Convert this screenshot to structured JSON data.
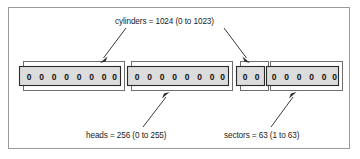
{
  "figure": {
    "background_color": "#ffffff",
    "frame_color": "#9a9a9a"
  },
  "annotations": {
    "cylinders": {
      "label": "cylinders = 1024 (0 to 1023)",
      "name": "cylinders",
      "count": 1024,
      "range_start": 0,
      "range_end": 1023
    },
    "heads": {
      "label": "heads = 256 (0 to 255)",
      "name": "heads",
      "count": 256,
      "range_start": 0,
      "range_end": 255
    },
    "sectors": {
      "label": "sectors = 63 (1 to 63)",
      "name": "sectors",
      "count": 63,
      "range_start": 1,
      "range_end": 63
    }
  },
  "bit_groups": [
    {
      "id": "cylinder-bits-high",
      "digits": "0 0 0 0 0 0 0 0",
      "bit_count": 8,
      "fill": "#dcdcdc"
    },
    {
      "id": "head-bits",
      "digits": "0 0 0 0 0 0 0 0",
      "bit_count": 8,
      "fill": "#dcdcdc"
    },
    {
      "id": "cylinder-bits-low",
      "digits": "0 0",
      "bit_count": 2,
      "fill": "#dcdcdc"
    },
    {
      "id": "sector-bits",
      "digits": "0 0 0 0 0 0",
      "bit_count": 6,
      "fill": "#dcdcdc"
    }
  ],
  "arrows": [
    {
      "id": "arrow-cylinders-left",
      "from": "cylinders",
      "to": "cylinder-bits-high"
    },
    {
      "id": "arrow-cylinders-right",
      "from": "cylinders",
      "to": "cylinder-bits-low"
    },
    {
      "id": "arrow-heads",
      "from": "heads",
      "to": "head-bits"
    },
    {
      "id": "arrow-sectors",
      "from": "sectors",
      "to": "sector-bits"
    }
  ],
  "colors": {
    "bit_fill": "#dcdcdc",
    "bit_stroke": "#2b2b2b",
    "outline_stroke": "#6e6e6e",
    "arrow": "#3a3a3a",
    "text": "#1b1b1b"
  }
}
